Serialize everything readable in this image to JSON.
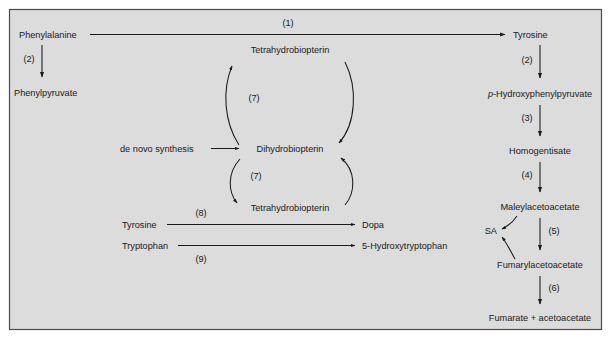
{
  "figure": {
    "background_color": "#dcdcdc",
    "border_color": "#4a4a4a",
    "text_color": "#1a1a1a",
    "arrow_color": "#1a1a1a"
  },
  "nodes": {
    "phenylalanine": "Phenylalanine",
    "phenylpyruvate": "Phenylpyruvate",
    "tyrosine_top": "Tyrosine",
    "hydroxyphenylpyruvate_prefix": "p",
    "hydroxyphenylpyruvate_rest": "-Hydroxyphenylpyruvate",
    "homogentisate": "Homogentisate",
    "maleylacetoacetate": "Maleylacetoacetate",
    "fumarylacetoacetate": "Fumarylacetoacetate",
    "fumarate_acetoacetate": "Fumarate + acetoacetate",
    "sa": "SA",
    "tetrahydrobiopterin_upper": "Tetrahydrobiopterin",
    "dihydrobiopterin": "Dihydrobiopterin",
    "tetrahydrobiopterin_lower": "Tetrahydrobiopterin",
    "de_novo_synthesis": "de novo synthesis",
    "tyrosine_lower": "Tyrosine",
    "tryptophan": "Tryptophan",
    "dopa": "Dopa",
    "hydroxytryptophan": "5-Hydroxytryptophan"
  },
  "steps": {
    "s1": "(1)",
    "s2_left": "(2)",
    "s2_right": "(2)",
    "s3": "(3)",
    "s4": "(4)",
    "s5": "(5)",
    "s6": "(6)",
    "s7_upper": "(7)",
    "s7_lower": "(7)",
    "s8": "(8)",
    "s9": "(9)"
  },
  "reactions": [
    {
      "id": "1",
      "from": "Phenylalanine",
      "to": "Tyrosine",
      "label": "(1)"
    },
    {
      "id": "2",
      "from": "Phenylalanine",
      "to": "Phenylpyruvate",
      "label": "(2)"
    },
    {
      "id": "2r",
      "from": "Tyrosine",
      "to": "p-Hydroxyphenylpyruvate",
      "label": "(2)"
    },
    {
      "id": "3",
      "from": "p-Hydroxyphenylpyruvate",
      "to": "Homogentisate",
      "label": "(3)"
    },
    {
      "id": "4",
      "from": "Homogentisate",
      "to": "Maleylacetoacetate",
      "label": "(4)"
    },
    {
      "id": "5",
      "from": "Maleylacetoacetate",
      "to": "Fumarylacetoacetate",
      "label": "(5)"
    },
    {
      "id": "6",
      "from": "Fumarylacetoacetate",
      "to": "Fumarate + acetoacetate",
      "label": "(6)"
    },
    {
      "id": "7u",
      "from": "Dihydrobiopterin",
      "to": "Tetrahydrobiopterin",
      "label": "(7)"
    },
    {
      "id": "7l",
      "from": "Dihydrobiopterin",
      "to": "Tetrahydrobiopterin",
      "label": "(7)"
    },
    {
      "id": "8",
      "from": "Tyrosine",
      "to": "Dopa",
      "label": "(8)"
    },
    {
      "id": "9",
      "from": "Tryptophan",
      "to": "5-Hydroxytryptophan",
      "label": "(9)"
    },
    {
      "id": "dn",
      "from": "de novo synthesis",
      "to": "Dihydrobiopterin",
      "label": ""
    },
    {
      "id": "sa1",
      "from": "Maleylacetoacetate",
      "to": "SA",
      "label": ""
    },
    {
      "id": "sa2",
      "from": "Fumarylacetoacetate",
      "to": "SA",
      "label": ""
    }
  ]
}
